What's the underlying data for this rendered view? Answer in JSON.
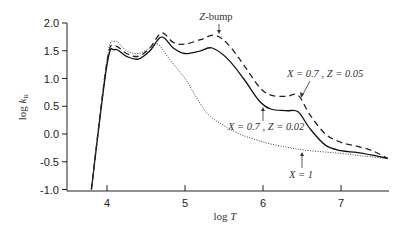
{
  "chart_data": {
    "type": "line",
    "title": "",
    "xlabel": "log T",
    "ylabel": "log k_R",
    "xlim": [
      3.5,
      7.6
    ],
    "ylim": [
      -1.0,
      2.0
    ],
    "xticks": [
      4,
      5,
      6,
      7
    ],
    "yticks": [
      2.0,
      1.5,
      1.0,
      0.5,
      0.0,
      -0.5,
      -1.0
    ],
    "ytick_labels": [
      "2.0",
      "1.5",
      "1.0",
      "0.5",
      "0.0",
      "-0.5",
      "-1.0"
    ],
    "grid": false,
    "legend": "none (inline annotations)",
    "series": [
      {
        "name": "X = 0.7 , Z = 0.05",
        "style": "dashed",
        "color": "#222222",
        "x": [
          3.8,
          4.0,
          4.1,
          4.25,
          4.4,
          4.55,
          4.7,
          4.85,
          5.0,
          5.2,
          5.38,
          5.55,
          5.75,
          5.95,
          6.1,
          6.3,
          6.45,
          6.6,
          6.8,
          7.0,
          7.2,
          7.4,
          7.6
        ],
        "y": [
          -1.0,
          1.3,
          1.58,
          1.45,
          1.4,
          1.55,
          1.82,
          1.65,
          1.62,
          1.7,
          1.78,
          1.62,
          1.25,
          0.85,
          0.7,
          0.68,
          0.7,
          0.35,
          0.0,
          -0.15,
          -0.22,
          -0.3,
          -0.44
        ]
      },
      {
        "name": "X = 0.7 , Z = 0.02",
        "style": "solid",
        "color": "#111111",
        "x": [
          3.8,
          4.0,
          4.1,
          4.25,
          4.4,
          4.55,
          4.7,
          4.85,
          5.0,
          5.2,
          5.35,
          5.55,
          5.75,
          5.95,
          6.1,
          6.3,
          6.45,
          6.6,
          6.8,
          7.0,
          7.2,
          7.4,
          7.6
        ],
        "y": [
          -1.0,
          1.25,
          1.52,
          1.4,
          1.35,
          1.5,
          1.75,
          1.55,
          1.45,
          1.5,
          1.55,
          1.35,
          1.0,
          0.6,
          0.45,
          0.42,
          0.4,
          0.1,
          -0.2,
          -0.3,
          -0.33,
          -0.38,
          -0.44
        ]
      },
      {
        "name": "X = 1",
        "style": "dotted",
        "color": "#444444",
        "x": [
          3.8,
          4.0,
          4.1,
          4.25,
          4.4,
          4.55,
          4.65,
          4.8,
          5.0,
          5.15,
          5.3,
          5.5,
          5.7,
          5.9,
          6.1,
          6.35,
          6.6,
          7.0,
          7.3,
          7.6
        ],
        "y": [
          -1.0,
          1.35,
          1.67,
          1.5,
          1.45,
          1.55,
          1.62,
          1.35,
          1.0,
          0.65,
          0.35,
          0.15,
          0.0,
          -0.1,
          -0.18,
          -0.25,
          -0.3,
          -0.35,
          -0.4,
          -0.44
        ]
      }
    ],
    "annotations": [
      {
        "text": "Z-bump",
        "x": 5.38,
        "y": 1.78
      },
      {
        "text": "X = 0.7 , Z = 0.05",
        "x": 6.45,
        "y": 0.7
      },
      {
        "text": "X = 0.7 , Z = 0.02",
        "x": 5.95,
        "y": 0.55
      },
      {
        "text": "X = 1",
        "x": 6.5,
        "y": -0.27
      }
    ]
  },
  "labels": {
    "xlabel_log": "log ",
    "xlabel_var": "T",
    "ylabel_log": "log ",
    "ylabel_var": "k",
    "ylabel_sub": "R",
    "zbump_z": "Z",
    "zbump_rest": "-bump",
    "annot_005": "X = 0.7 , Z = 0.05",
    "annot_002": "X = 0.7 , Z = 0.02",
    "annot_x1": "X = 1"
  }
}
